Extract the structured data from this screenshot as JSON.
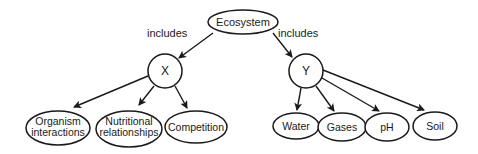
{
  "diagram": {
    "root": {
      "label": "Ecosystem"
    },
    "edge_labels": {
      "left": "includes",
      "right": "includes"
    },
    "x_node": {
      "label": "X"
    },
    "y_node": {
      "label": "Y"
    },
    "x_children": [
      {
        "line1": "Organism",
        "line2": "interactions"
      },
      {
        "line1": "Nutritional",
        "line2": "relationships"
      },
      {
        "label": "Competition"
      }
    ],
    "y_children": [
      {
        "label": "Water"
      },
      {
        "label": "Gases"
      },
      {
        "label": "pH"
      },
      {
        "label": "Soil"
      }
    ],
    "colors": {
      "stroke": "#1a1a1a",
      "background": "#ffffff"
    }
  }
}
